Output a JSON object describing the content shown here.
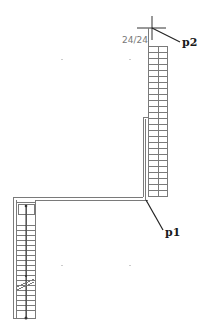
{
  "diagram": {
    "type": "staircase-plan",
    "annotation": {
      "ratio_text": "24/24"
    },
    "points": [
      {
        "id": "p2",
        "label": "p2"
      },
      {
        "id": "p1",
        "label": "p1"
      }
    ],
    "upper_flight": {
      "treads": 24
    },
    "lower_flight": {
      "treads": 24
    },
    "colors": {
      "background": "#ffffff",
      "stroke": "#7a7a7a",
      "leader": "#222222"
    }
  }
}
